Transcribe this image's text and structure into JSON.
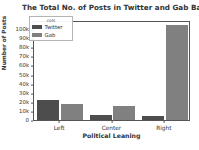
{
  "chart_data": {
    "type": "bar",
    "title": "The Total No. of Posts in Twitter and Gab Based on Media Bia",
    "xlabel": "Political Leaning",
    "ylabel": "Number of Posts",
    "categories": [
      "Left",
      "Center",
      "Right"
    ],
    "series": [
      {
        "name": "Twitter",
        "color": "#4d4d4d",
        "values": [
          22000,
          5000,
          4000
        ]
      },
      {
        "name": "Gab",
        "color": "#808080",
        "values": [
          18000,
          15000,
          105000
        ]
      }
    ],
    "ylim": [
      0,
      110000
    ],
    "ytick_values": [
      0,
      10000,
      20000,
      30000,
      40000,
      50000,
      60000,
      70000,
      80000,
      90000,
      100000
    ],
    "ytick_labels": [
      "0",
      "10k",
      "20k",
      "30k",
      "40k",
      "50k",
      "60k",
      "70k",
      "80k",
      "90k",
      "100k"
    ],
    "grid": false,
    "legend_position": "upper left",
    "legend_title": "cols"
  }
}
